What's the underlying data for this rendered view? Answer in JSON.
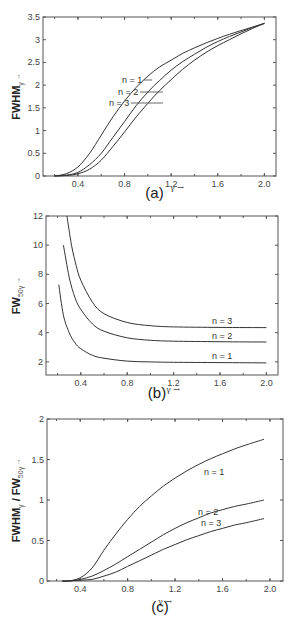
{
  "chart_data": [
    {
      "id": "a",
      "type": "line",
      "caption": "(a)",
      "title": "",
      "xlabel": "γ →",
      "ylabel": "FWHM",
      "ylabel_sub": "γ",
      "ylabel_arrow": "→",
      "xlim": [
        0.1,
        2.1
      ],
      "ylim": [
        0,
        3.5
      ],
      "xticks": [
        0.4,
        0.8,
        1.2,
        1.6,
        2.0
      ],
      "xtick_labels": [
        "0.4",
        "0.8",
        "1.2",
        "1.6",
        "2.0"
      ],
      "yticks": [
        0,
        0.5,
        1,
        1.5,
        2,
        2.5,
        3,
        3.5
      ],
      "ytick_labels": [
        "0",
        "0.5",
        "1",
        "1.5",
        "2",
        "2.5",
        "3",
        "3.5"
      ],
      "grid": false,
      "x": [
        0.2,
        0.3,
        0.4,
        0.5,
        0.6,
        0.7,
        0.8,
        0.9,
        1.0,
        1.1,
        1.2,
        1.3,
        1.4,
        1.5,
        1.6,
        1.7,
        1.8,
        1.9,
        2.0
      ],
      "series": [
        {
          "name": "n = 1",
          "values": [
            0.0,
            0.05,
            0.2,
            0.5,
            0.9,
            1.3,
            1.65,
            1.95,
            2.2,
            2.4,
            2.55,
            2.7,
            2.82,
            2.93,
            3.03,
            3.12,
            3.2,
            3.28,
            3.36
          ]
        },
        {
          "name": "n = 2",
          "values": [
            0.0,
            0.02,
            0.08,
            0.25,
            0.5,
            0.85,
            1.2,
            1.55,
            1.85,
            2.1,
            2.33,
            2.52,
            2.68,
            2.83,
            2.96,
            3.07,
            3.17,
            3.27,
            3.36
          ]
        },
        {
          "name": "n = 3",
          "values": [
            0.0,
            0.01,
            0.05,
            0.15,
            0.35,
            0.65,
            0.97,
            1.3,
            1.6,
            1.88,
            2.12,
            2.35,
            2.55,
            2.72,
            2.87,
            3.0,
            3.13,
            3.25,
            3.36
          ]
        }
      ],
      "annotations": [
        {
          "text": "n = 1",
          "at_x": 1.0,
          "at_y": 2.1
        },
        {
          "text": "n = 2",
          "at_x": 1.1,
          "at_y": 1.85
        },
        {
          "text": "n = 3",
          "at_x": 1.1,
          "at_y": 1.6
        }
      ]
    },
    {
      "id": "b",
      "type": "line",
      "caption": "(b)",
      "title": "",
      "xlabel": "γ →",
      "ylabel": "FW",
      "ylabel_sub": "50γ",
      "ylabel_arrow": "→",
      "xlim": [
        0.1,
        2.1
      ],
      "ylim": [
        1.1,
        12
      ],
      "xticks": [
        0.4,
        0.8,
        1.2,
        1.6,
        2.0
      ],
      "xtick_labels": [
        "0.4",
        "0.8",
        "1.2",
        "1.6",
        "2.0"
      ],
      "yticks": [
        2,
        4,
        6,
        8,
        10,
        12
      ],
      "ytick_labels": [
        "2",
        "4",
        "6",
        "8",
        "10",
        "12"
      ],
      "grid": false,
      "series": [
        {
          "name": "n = 1",
          "x": [
            0.21,
            0.25,
            0.3,
            0.35,
            0.4,
            0.5,
            0.6,
            0.8,
            1.0,
            1.2,
            1.6,
            2.0
          ],
          "values": [
            7.3,
            5.2,
            4.0,
            3.3,
            2.9,
            2.45,
            2.25,
            2.05,
            2.0,
            1.97,
            1.95,
            1.93
          ]
        },
        {
          "name": "n = 2",
          "x": [
            0.25,
            0.3,
            0.35,
            0.4,
            0.5,
            0.6,
            0.8,
            1.0,
            1.2,
            1.6,
            2.0
          ],
          "values": [
            10.0,
            7.8,
            6.4,
            5.6,
            4.6,
            4.1,
            3.65,
            3.48,
            3.42,
            3.38,
            3.36
          ]
        },
        {
          "name": "n = 3",
          "x": [
            0.28,
            0.32,
            0.36,
            0.4,
            0.5,
            0.6,
            0.8,
            1.0,
            1.2,
            1.6,
            2.0
          ],
          "values": [
            12.0,
            10.0,
            8.6,
            7.6,
            6.1,
            5.3,
            4.7,
            4.48,
            4.4,
            4.36,
            4.35
          ]
        }
      ],
      "annotations": [
        {
          "text": "n = 3",
          "at_x": 1.6,
          "at_y": 4.6
        },
        {
          "text": "n = 2",
          "at_x": 1.6,
          "at_y": 3.6
        },
        {
          "text": "n = 1",
          "at_x": 1.6,
          "at_y": 2.2
        }
      ]
    },
    {
      "id": "c",
      "type": "line",
      "caption": "(c)",
      "title": "",
      "xlabel": "γ →",
      "ylabel": "FWHM",
      "ylabel_sub": "γ",
      "ylabel_mid": " / FW",
      "ylabel_sub2": "50γ",
      "ylabel_arrow": "→",
      "xlim": [
        0.12,
        2.11
      ],
      "ylim": [
        0,
        2
      ],
      "xticks": [
        0.4,
        0.8,
        1.2,
        1.6,
        2.0
      ],
      "xtick_labels": [
        "0.4",
        "0.8",
        "1.2",
        "1.6",
        "2.0"
      ],
      "yticks": [
        0,
        0.5,
        1,
        1.5,
        2
      ],
      "ytick_labels": [
        "0",
        "0.5",
        "1",
        "1.5",
        "2"
      ],
      "grid": false,
      "x": [
        0.25,
        0.3,
        0.4,
        0.5,
        0.6,
        0.7,
        0.8,
        0.9,
        1.0,
        1.1,
        1.2,
        1.3,
        1.4,
        1.5,
        1.6,
        1.7,
        1.8,
        1.95
      ],
      "series": [
        {
          "name": "n = 1",
          "values": [
            0.0,
            0.0,
            0.04,
            0.16,
            0.38,
            0.58,
            0.76,
            0.92,
            1.05,
            1.17,
            1.27,
            1.36,
            1.44,
            1.51,
            1.57,
            1.63,
            1.68,
            1.75
          ]
        },
        {
          "name": "n = 2",
          "values": [
            0.0,
            0.0,
            0.02,
            0.06,
            0.13,
            0.21,
            0.3,
            0.39,
            0.48,
            0.57,
            0.65,
            0.72,
            0.78,
            0.84,
            0.88,
            0.92,
            0.95,
            1.0
          ]
        },
        {
          "name": "n = 3",
          "values": [
            0.0,
            0.0,
            0.01,
            0.02,
            0.06,
            0.11,
            0.18,
            0.25,
            0.32,
            0.39,
            0.45,
            0.51,
            0.56,
            0.61,
            0.65,
            0.69,
            0.72,
            0.77
          ]
        }
      ],
      "annotations": [
        {
          "text": "n = 1",
          "at_x": 1.5,
          "at_y": 1.35
        },
        {
          "text": "n = 2",
          "at_x": 1.35,
          "at_y": 0.85
        },
        {
          "text": "n = 3",
          "at_x": 1.4,
          "at_y": 0.67
        }
      ]
    }
  ]
}
